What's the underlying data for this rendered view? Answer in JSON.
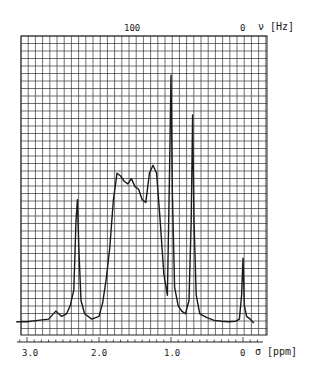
{
  "chart_data": {
    "type": "line",
    "title": "",
    "xlabel": "σ [ppm]",
    "x2label": "ν [Hz]",
    "ylabel": "",
    "x_ticks_ppm": [
      "3.0",
      "2.0",
      "1.0",
      "0"
    ],
    "x2_ticks_hz": [
      "100",
      "0"
    ],
    "xlim_ppm": [
      3.15,
      -0.2
    ],
    "grid": true,
    "series": [
      {
        "name": "1H NMR spectrum",
        "x_ppm": [
          3.15,
          3.0,
          2.85,
          2.7,
          2.6,
          2.52,
          2.45,
          2.4,
          2.35,
          2.32,
          2.3,
          2.28,
          2.25,
          2.2,
          2.1,
          2.0,
          1.95,
          1.9,
          1.85,
          1.8,
          1.75,
          1.7,
          1.65,
          1.6,
          1.55,
          1.5,
          1.45,
          1.4,
          1.35,
          1.3,
          1.25,
          1.2,
          1.15,
          1.1,
          1.05,
          1.02,
          1.0,
          0.98,
          0.95,
          0.9,
          0.85,
          0.8,
          0.75,
          0.72,
          0.7,
          0.68,
          0.65,
          0.6,
          0.5,
          0.4,
          0.3,
          0.2,
          0.1,
          0.05,
          0.02,
          0.0,
          -0.02,
          -0.05,
          -0.1,
          -0.15
        ],
        "y_rel": [
          2,
          2,
          2.5,
          3,
          6,
          4,
          5,
          8,
          14,
          40,
          48,
          30,
          10,
          5,
          3,
          4,
          9,
          18,
          30,
          48,
          58,
          57,
          55,
          54,
          56,
          53,
          52,
          48,
          47,
          58,
          61,
          58,
          40,
          20,
          12,
          60,
          95,
          50,
          15,
          8,
          6,
          5,
          10,
          40,
          80,
          40,
          12,
          5,
          3.5,
          2.5,
          2.2,
          2,
          2.2,
          3,
          12,
          26,
          8,
          4,
          3,
          1.5
        ]
      }
    ],
    "peaks": [
      {
        "ppm": 2.3,
        "label": "sharp singlet"
      },
      {
        "ppm": 1.6,
        "label": "multiplet 1.2-1.8"
      },
      {
        "ppm": 1.0,
        "label": "tallest singlet"
      },
      {
        "ppm": 0.7,
        "label": "singlet"
      },
      {
        "ppm": 0.0,
        "label": "TMS reference"
      }
    ]
  },
  "labels": {
    "top_100": "100",
    "top_0": "0",
    "top_unit": "ν [Hz]",
    "bottom_3": "3.0",
    "bottom_2": "2.0",
    "bottom_1": "1.0",
    "bottom_0": "0",
    "bottom_unit": "σ [ppm]"
  }
}
